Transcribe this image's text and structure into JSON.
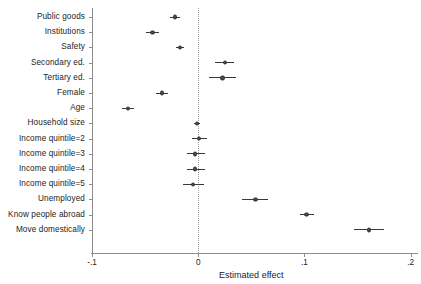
{
  "chart_data": {
    "type": "scatter",
    "subtype": "coefficient-forest-plot",
    "title": "",
    "xlabel": "Estimated effect",
    "ylabel": "",
    "xlim": [
      -0.1,
      0.2
    ],
    "xticks": [
      -0.1,
      0,
      0.1,
      0.2
    ],
    "xtick_labels": [
      "-.1",
      "0",
      ".1",
      ".2"
    ],
    "grid": false,
    "legend": null,
    "reference_line": {
      "x": 0,
      "style": "dotted"
    },
    "orientation": "horizontal",
    "categories": [
      "Public goods",
      "Institutions",
      "Safety",
      "Secondary ed.",
      "Tertiary ed.",
      "Female",
      "Age",
      "Household size",
      "Income quintile=2",
      "Income quintile=3",
      "Income quintile=4",
      "Income quintile=5",
      "Unemployed",
      "Know people abroad",
      "Move domestically"
    ],
    "points": [
      {
        "label": "Public goods",
        "estimate": -0.022,
        "ci_low": -0.027,
        "ci_high": -0.017
      },
      {
        "label": "Institutions",
        "estimate": -0.043,
        "ci_low": -0.049,
        "ci_high": -0.037
      },
      {
        "label": "Safety",
        "estimate": -0.017,
        "ci_low": -0.021,
        "ci_high": -0.013
      },
      {
        "label": "Secondary ed.",
        "estimate": 0.025,
        "ci_low": 0.016,
        "ci_high": 0.034
      },
      {
        "label": "Tertiary ed.",
        "estimate": 0.023,
        "ci_low": 0.01,
        "ci_high": 0.036
      },
      {
        "label": "Female",
        "estimate": -0.034,
        "ci_low": -0.04,
        "ci_high": -0.028
      },
      {
        "label": "Age",
        "estimate": -0.066,
        "ci_low": -0.072,
        "ci_high": -0.06
      },
      {
        "label": "Household size",
        "estimate": -0.001,
        "ci_low": -0.004,
        "ci_high": 0.002
      },
      {
        "label": "Income quintile=2",
        "estimate": 0.001,
        "ci_low": -0.006,
        "ci_high": 0.008
      },
      {
        "label": "Income quintile=3",
        "estimate": -0.003,
        "ci_low": -0.011,
        "ci_high": 0.006
      },
      {
        "label": "Income quintile=4",
        "estimate": -0.003,
        "ci_low": -0.011,
        "ci_high": 0.006
      },
      {
        "label": "Income quintile=5",
        "estimate": -0.005,
        "ci_low": -0.014,
        "ci_high": 0.005
      },
      {
        "label": "Unemployed",
        "estimate": 0.054,
        "ci_low": 0.041,
        "ci_high": 0.066
      },
      {
        "label": "Know people abroad",
        "estimate": 0.102,
        "ci_low": 0.096,
        "ci_high": 0.109
      },
      {
        "label": "Move domestically",
        "estimate": 0.161,
        "ci_low": 0.147,
        "ci_high": 0.175
      }
    ],
    "colors": {
      "marker": "#4b4b4b",
      "ci": "#3a3a3a",
      "axis": "#8d8d8d",
      "reference_line": "#9a9a9a",
      "text": "#1c1c1c",
      "background": "#ffffff"
    }
  }
}
